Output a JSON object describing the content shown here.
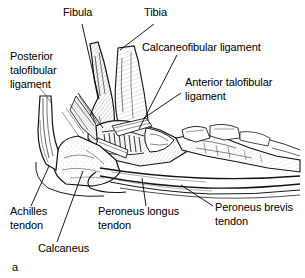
{
  "figure": {
    "letter": "a",
    "ink_color": "#1a1a1a",
    "background_color": "#ffffff"
  },
  "labels": {
    "fibula": "Fibula",
    "tibia": "Tibia",
    "calcaneofibular": "Calcaneofibular ligament",
    "posterior_talofibular_l1": "Posterior",
    "posterior_talofibular_l2": "talofibular",
    "posterior_talofibular_l3": "ligament",
    "anterior_talofibular_l1": "Anterior talofibular",
    "anterior_talofibular_l2": "ligament",
    "achilles_l1": "Achilles",
    "achilles_l2": "tendon",
    "calcaneus": "Calcaneus",
    "peroneus_longus_l1": "Peroneus longus",
    "peroneus_longus_l2": "tendon",
    "peroneus_brevis_l1": "Peroneus brevis",
    "peroneus_brevis_l2": "tendon"
  }
}
